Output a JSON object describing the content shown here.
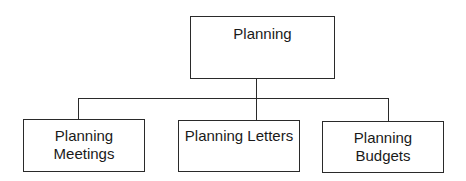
{
  "diagram": {
    "type": "org-chart",
    "root": {
      "label": "Planning"
    },
    "children": [
      {
        "line1": "Planning",
        "line2": "Meetings"
      },
      {
        "line1": "Planning Letters",
        "line2": ""
      },
      {
        "line1": "Planning",
        "line2": "Budgets"
      }
    ],
    "colors": {
      "stroke": "#2a2a2a",
      "background": "#ffffff"
    }
  }
}
